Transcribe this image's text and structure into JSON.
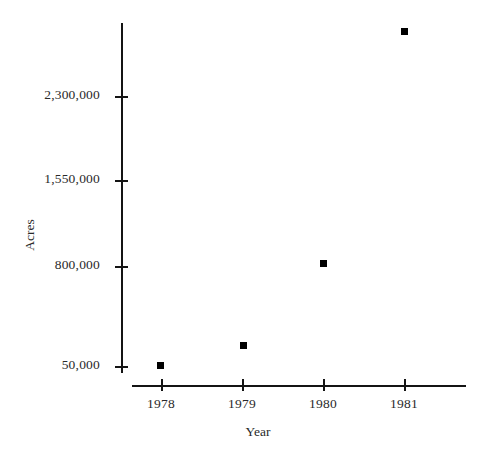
{
  "chart_data": {
    "type": "scatter",
    "title": "",
    "xlabel": "Year",
    "ylabel": "Acres",
    "grid": false,
    "legend": "none",
    "categories": [
      "1978",
      "1979",
      "1980",
      "1981"
    ],
    "x": [
      1978,
      1979,
      1980,
      1981
    ],
    "values": [
      58000,
      225000,
      908000,
      2842000
    ],
    "series": [
      {
        "name": "Acres",
        "marker": "filled-square",
        "color": "#000000",
        "values": [
          58000,
          225000,
          908000,
          2842000
        ]
      }
    ],
    "xtick_labels": [
      "1978",
      "1979",
      "1980",
      "1981"
    ],
    "ytick_labels": [
      "50,000",
      "800,000",
      "1,550,000",
      "2,300,000"
    ],
    "ytick_values": [
      50000,
      800000,
      1550000,
      2300000
    ],
    "ylim": [
      50000,
      3050000
    ],
    "xlim": [
      1977.6,
      1981.8
    ]
  },
  "axes": {
    "y_title": "Acres",
    "x_title": "Year",
    "y_ticks": [
      {
        "label": "2,300,000",
        "value": 2300000,
        "top": 96
      },
      {
        "label": "1,550,000",
        "value": 1550000,
        "top": 180
      },
      {
        "label": "800,000",
        "value": 800000,
        "top": 266
      },
      {
        "label": "50,000",
        "value": 50000,
        "top": 366
      }
    ],
    "x_ticks": [
      {
        "label": "1978",
        "value": 1978,
        "left": 161
      },
      {
        "label": "1979",
        "value": 1979,
        "left": 242
      },
      {
        "label": "1980",
        "value": 1980,
        "left": 323
      },
      {
        "label": "1981",
        "value": 1981,
        "left": 404
      }
    ]
  },
  "points": [
    {
      "label": "1978",
      "value": 58000,
      "left": 160,
      "top": 365
    },
    {
      "label": "1979",
      "value": 225000,
      "left": 243,
      "top": 345
    },
    {
      "label": "1980",
      "value": 908000,
      "left": 323,
      "top": 263
    },
    {
      "label": "1981",
      "value": 2842000,
      "left": 404,
      "top": 31
    }
  ],
  "colors": {
    "marker": "#000000",
    "axis": "#141414",
    "text": "#2a2a2a",
    "background": "#ffffff"
  }
}
